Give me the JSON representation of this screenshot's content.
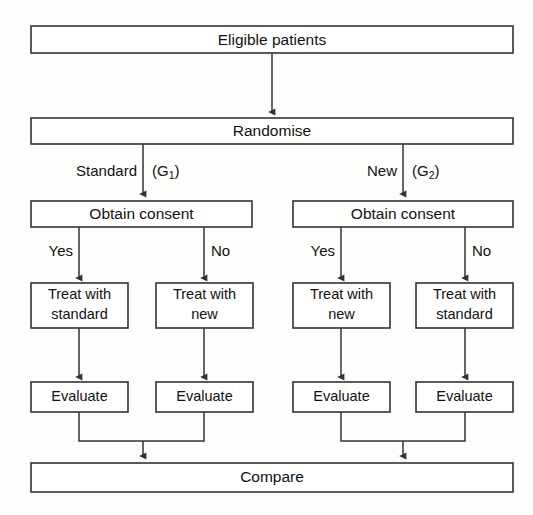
{
  "diagram": {
    "type": "flowchart",
    "orientation": "top-to-bottom",
    "nodes": {
      "eligible": "Eligible patients",
      "randomise": "Randomise",
      "consent_left": "Obtain consent",
      "consent_right": "Obtain consent",
      "treat_1_line1": "Treat with",
      "treat_1_line2": "standard",
      "treat_2_line1": "Treat with",
      "treat_2_line2": "new",
      "treat_3_line1": "Treat with",
      "treat_3_line2": "new",
      "treat_4_line1": "Treat with",
      "treat_4_line2": "standard",
      "evaluate_1": "Evaluate",
      "evaluate_2": "Evaluate",
      "evaluate_3": "Evaluate",
      "evaluate_4": "Evaluate",
      "compare": "Compare"
    },
    "edge_labels": {
      "arm_left_name": "Standard",
      "arm_left_group_open": "(G",
      "arm_left_group_sub": "1",
      "arm_left_group_close": ")",
      "arm_right_name": "New",
      "arm_right_group_open": "(G",
      "arm_right_group_sub": "2",
      "arm_right_group_close": ")",
      "consent_left_yes": "Yes",
      "consent_left_no": "No",
      "consent_right_yes": "Yes",
      "consent_right_no": "No"
    },
    "colors": {
      "stroke": "#333333",
      "box_fill": "#ffffff",
      "text": "#111111",
      "background": "#fdfdfc"
    }
  }
}
